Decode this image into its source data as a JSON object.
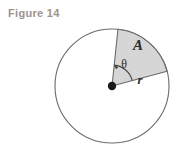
{
  "figure": {
    "caption": "Figure 14",
    "caption_color": "#9b948f",
    "background_color": "#ffffff"
  },
  "diagram": {
    "type": "circle-sector-geometry",
    "circle": {
      "center_x": 112,
      "center_y": 86,
      "radius": 57,
      "stroke_color": "#6f6a66",
      "stroke_width": 1,
      "fill": "none"
    },
    "center_point": {
      "label": "center-dot",
      "x": 112,
      "y": 86,
      "radius": 4,
      "color": "#1a1a1a"
    },
    "sector": {
      "fill_color": "#d6d6d6",
      "stroke_color": "#6f6a66",
      "start_angle_deg": 15,
      "end_angle_deg": 84,
      "start_point_x": 167,
      "start_point_y": 71,
      "end_point_x": 118,
      "end_point_y": 29
    },
    "angle_arc": {
      "label": "theta-arc",
      "radius": 21,
      "stroke_color": "#4a4643",
      "arrow": "arrowhead-at-upper-end"
    },
    "labels": {
      "area": "A",
      "angle": "θ",
      "radius": "r"
    },
    "label_positions": {
      "area": {
        "x": 138,
        "y": 50
      },
      "angle": {
        "x": 124,
        "y": 68
      },
      "radius": {
        "x": 140,
        "y": 83
      }
    }
  }
}
